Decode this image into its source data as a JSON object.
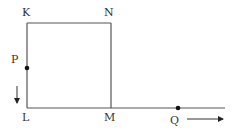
{
  "diagram": {
    "type": "geometry",
    "points": {
      "K": {
        "label": "K",
        "x": 27,
        "y": 23
      },
      "N": {
        "label": "N",
        "x": 111,
        "y": 23
      },
      "L": {
        "label": "L",
        "x": 27,
        "y": 108
      },
      "M": {
        "label": "M",
        "x": 111,
        "y": 108
      },
      "P": {
        "label": "P",
        "x": 27,
        "y": 68
      },
      "Q": {
        "label": "Q",
        "x": 178,
        "y": 108
      }
    },
    "segments": [
      {
        "from": "K",
        "to": "N"
      },
      {
        "from": "N",
        "to": "M"
      },
      {
        "from": "K",
        "to": "L"
      },
      {
        "from": "L",
        "to": "line_end"
      }
    ],
    "line_end": {
      "x": 225,
      "y": 108
    },
    "arrows": [
      {
        "name": "p-direction",
        "direction": "down",
        "x1": 17,
        "y1": 86,
        "x2": 17,
        "y2": 104
      },
      {
        "name": "q-direction",
        "direction": "right",
        "x1": 187,
        "y1": 119,
        "x2": 224,
        "y2": 119
      }
    ],
    "colors": {
      "line": "#555555",
      "point": "#111111",
      "label": "#333333"
    }
  }
}
